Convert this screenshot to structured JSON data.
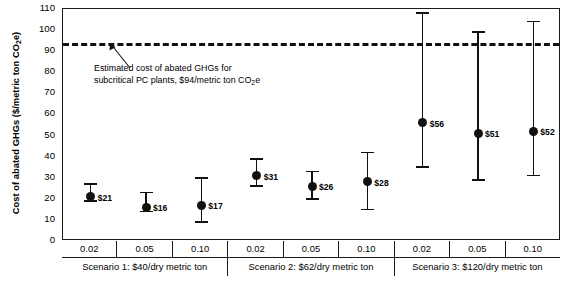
{
  "chart_data": {
    "type": "scatter",
    "title": "",
    "ylabel": "Cost of abated GHGs ($/metric ton CO2e)",
    "ylabel_parts": {
      "pre": "Cost of abated GHGs ($/metric ton CO",
      "sub": "2",
      "post": "e)"
    },
    "xlabel": "",
    "ylim": [
      0,
      110
    ],
    "yticks": [
      0,
      10,
      20,
      30,
      40,
      50,
      60,
      70,
      80,
      90,
      100,
      110
    ],
    "grid": false,
    "legend": "none",
    "categories": [
      "0.02",
      "0.05",
      "0.10",
      "0.02",
      "0.05",
      "0.10",
      "0.02",
      "0.05",
      "0.10"
    ],
    "values": [
      21,
      16,
      17,
      31,
      26,
      28,
      56,
      51,
      52
    ],
    "value_labels": [
      "$21",
      "$16",
      "$17",
      "$31",
      "$26",
      "$28",
      "$56",
      "$51",
      "$52"
    ],
    "error_low": [
      19,
      14,
      9,
      26,
      20,
      15,
      35,
      29,
      31
    ],
    "error_high": [
      27,
      23,
      30,
      39,
      33,
      42,
      108,
      99,
      104
    ],
    "reference_line": {
      "value": 94,
      "style": "dashed",
      "label_line1": "Estimated cost of abated GHGs for",
      "label_line2_pre": "subcritical PC plants, $94/metric ton CO",
      "label_line2_sub": "2",
      "label_line2_post": "e"
    },
    "groups": [
      {
        "label": "Scenario 1: $40/dry metric ton",
        "ticks": [
          "0.02",
          "0.05",
          "0.10"
        ]
      },
      {
        "label": "Scenario 2: $62/dry metric ton",
        "ticks": [
          "0.02",
          "0.05",
          "0.10"
        ]
      },
      {
        "label": "Scenario 3: $120/dry metric ton",
        "ticks": [
          "0.02",
          "0.05",
          "0.10"
        ]
      }
    ],
    "xaxis_caption": ""
  }
}
